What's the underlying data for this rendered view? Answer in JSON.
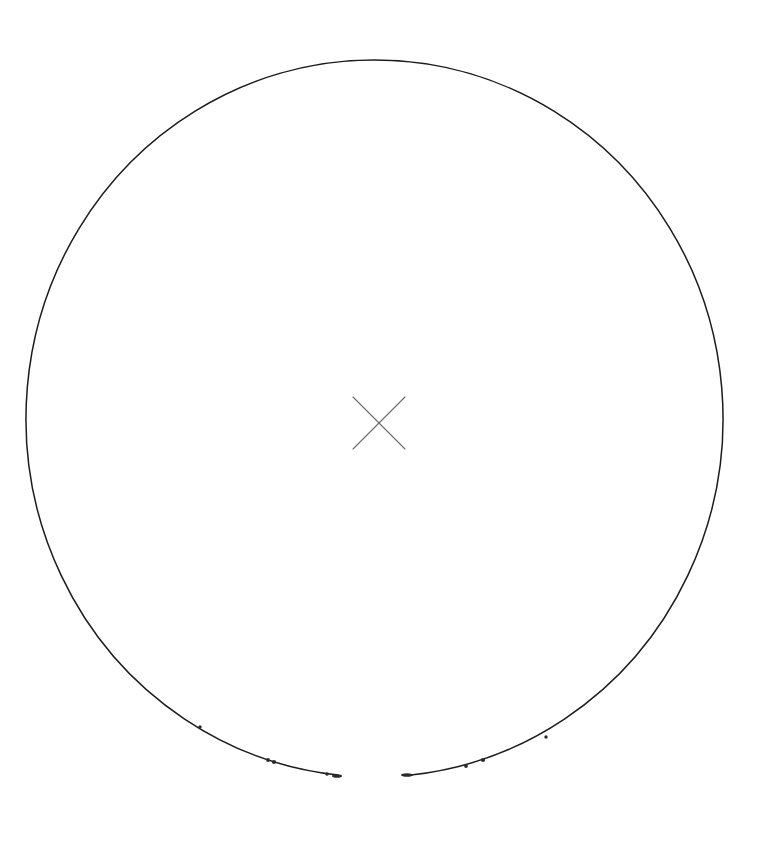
{
  "figure": {
    "title": "",
    "background_color": "#ffffff",
    "width": 764,
    "height": 845
  },
  "chart_data": {
    "type": "scatter",
    "title": "",
    "subtitle": "",
    "xlabel": "",
    "ylabel": "",
    "grid": false,
    "legend_position": "none",
    "axis_visible": false,
    "tick_labels": [],
    "annotations": [],
    "xlim": [
      0,
      764
    ],
    "ylim": [
      845,
      0
    ],
    "series": [
      {
        "name": "outer-circle",
        "shape": "circle",
        "stroke_color": "#1c1c1c",
        "stroke_width": 1.5,
        "fill": "none",
        "center_x": 374.5,
        "center_y": 418.5,
        "radius_x": 348.5,
        "radius_y": 358.5,
        "gap_start_deg": 84,
        "gap_end_deg": 96,
        "values": []
      },
      {
        "name": "center-cross-marker",
        "shape": "x",
        "stroke_color": "#6b6b6b",
        "stroke_width": 1.1,
        "center_x": 379,
        "center_y": 423,
        "size": 52,
        "values": [
          [
            379,
            423
          ]
        ]
      },
      {
        "name": "lower-arc-tick-marks",
        "shape": "dot",
        "stroke_color": "#2a2a2a",
        "marker_size": 3,
        "values": [
          [
            200,
            727
          ],
          [
            268,
            760
          ],
          [
            273,
            762
          ],
          [
            327,
            774
          ],
          [
            338,
            776
          ],
          [
            404,
            775
          ],
          [
            412,
            774
          ],
          [
            466,
            766
          ],
          [
            483,
            760
          ],
          [
            546,
            737
          ]
        ]
      }
    ]
  }
}
